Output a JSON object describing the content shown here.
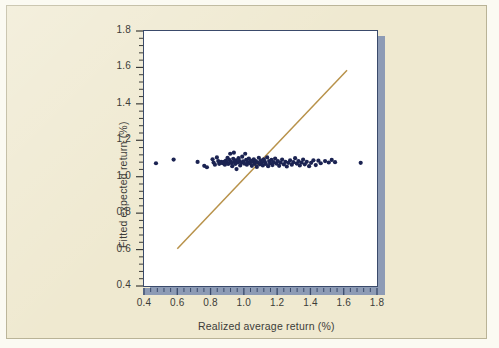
{
  "figure": {
    "background_color": "#efe9d0",
    "plot_background": "#ffffff",
    "frame_color": "#3a4a6b",
    "shadow_color": "#8d9bb5"
  },
  "chart_data": {
    "type": "scatter",
    "title": "",
    "xlabel": "Realized average return (%)",
    "ylabel": "Fitted expected return (%)",
    "xlim": [
      0.4,
      1.8
    ],
    "ylim": [
      0.4,
      1.8
    ],
    "xticks": [
      "0.4",
      "0.6",
      "0.8",
      "1.0",
      "1.2",
      "1.4",
      "1.6",
      "1.8"
    ],
    "yticks": [
      "0.4",
      "0.6",
      "0.8",
      "1.0",
      "1.2",
      "1.4",
      "1.6",
      "1.8"
    ],
    "xtick_values": [
      0.4,
      0.6,
      0.8,
      1.0,
      1.2,
      1.4,
      1.6,
      1.8
    ],
    "ytick_values": [
      0.4,
      0.6,
      0.8,
      1.0,
      1.2,
      1.4,
      1.6,
      1.8
    ],
    "minor_ticks_per_interval": 4,
    "grid": false,
    "legend": null,
    "marker_color": "#1b2352",
    "marker_size_px": 3.1,
    "series": [
      {
        "name": "Portfolios",
        "type": "scatter",
        "marker_color": "#1b2352",
        "points": [
          [
            0.472,
            1.074
          ],
          [
            0.578,
            1.094
          ],
          [
            0.722,
            1.081
          ],
          [
            0.762,
            1.06
          ],
          [
            0.778,
            1.052
          ],
          [
            0.812,
            1.096
          ],
          [
            0.818,
            1.078
          ],
          [
            0.826,
            1.066
          ],
          [
            0.838,
            1.106
          ],
          [
            0.846,
            1.086
          ],
          [
            0.852,
            1.071
          ],
          [
            0.864,
            1.081
          ],
          [
            0.872,
            1.074
          ],
          [
            0.88,
            1.082
          ],
          [
            0.886,
            1.066
          ],
          [
            0.892,
            1.088
          ],
          [
            0.898,
            1.078
          ],
          [
            0.902,
            1.104
          ],
          [
            0.906,
            1.07
          ],
          [
            0.912,
            1.092
          ],
          [
            0.918,
            1.126
          ],
          [
            0.922,
            1.081
          ],
          [
            0.926,
            1.075
          ],
          [
            0.93,
            1.058
          ],
          [
            0.936,
            1.098
          ],
          [
            0.94,
            1.132
          ],
          [
            0.944,
            1.082
          ],
          [
            0.948,
            1.07
          ],
          [
            0.952,
            1.09
          ],
          [
            0.956,
            1.042
          ],
          [
            0.962,
            1.078
          ],
          [
            0.968,
            1.102
          ],
          [
            0.974,
            1.086
          ],
          [
            0.978,
            1.062
          ],
          [
            0.984,
            1.076
          ],
          [
            0.99,
            1.11
          ],
          [
            0.996,
            1.084
          ],
          [
            1.002,
            1.072
          ],
          [
            1.008,
            1.126
          ],
          [
            1.014,
            1.092
          ],
          [
            1.018,
            1.066
          ],
          [
            1.024,
            1.08
          ],
          [
            1.03,
            1.1
          ],
          [
            1.036,
            1.074
          ],
          [
            1.042,
            1.088
          ],
          [
            1.048,
            1.06
          ],
          [
            1.054,
            1.082
          ],
          [
            1.06,
            1.096
          ],
          [
            1.066,
            1.07
          ],
          [
            1.072,
            1.086
          ],
          [
            1.078,
            1.054
          ],
          [
            1.084,
            1.078
          ],
          [
            1.09,
            1.104
          ],
          [
            1.096,
            1.068
          ],
          [
            1.102,
            1.09
          ],
          [
            1.108,
            1.076
          ],
          [
            1.114,
            1.062
          ],
          [
            1.12,
            1.096
          ],
          [
            1.126,
            1.082
          ],
          [
            1.132,
            1.07
          ],
          [
            1.14,
            1.106
          ],
          [
            1.146,
            1.058
          ],
          [
            1.152,
            1.086
          ],
          [
            1.158,
            1.074
          ],
          [
            1.166,
            1.092
          ],
          [
            1.172,
            1.064
          ],
          [
            1.18,
            1.08
          ],
          [
            1.188,
            1.1
          ],
          [
            1.196,
            1.072
          ],
          [
            1.204,
            1.086
          ],
          [
            1.212,
            1.06
          ],
          [
            1.22,
            1.078
          ],
          [
            1.23,
            1.094
          ],
          [
            1.24,
            1.068
          ],
          [
            1.25,
            1.082
          ],
          [
            1.258,
            1.056
          ],
          [
            1.268,
            1.076
          ],
          [
            1.278,
            1.09
          ],
          [
            1.288,
            1.066
          ],
          [
            1.298,
            1.08
          ],
          [
            1.308,
            1.102
          ],
          [
            1.318,
            1.072
          ],
          [
            1.328,
            1.086
          ],
          [
            1.336,
            1.062
          ],
          [
            1.346,
            1.078
          ],
          [
            1.356,
            1.094
          ],
          [
            1.366,
            1.068
          ],
          [
            1.378,
            1.082
          ],
          [
            1.392,
            1.058
          ],
          [
            1.404,
            1.076
          ],
          [
            1.418,
            1.09
          ],
          [
            1.432,
            1.064
          ],
          [
            1.448,
            1.088
          ],
          [
            1.462,
            1.074
          ],
          [
            1.488,
            1.086
          ],
          [
            1.51,
            1.078
          ],
          [
            1.528,
            1.092
          ],
          [
            1.548,
            1.08
          ],
          [
            1.702,
            1.076
          ]
        ]
      },
      {
        "name": "45-degree reference line",
        "type": "line",
        "line_color": "#b8924a",
        "x_start": 0.6,
        "y_start": 0.605,
        "x_end": 1.62,
        "y_end": 1.585
      }
    ]
  }
}
